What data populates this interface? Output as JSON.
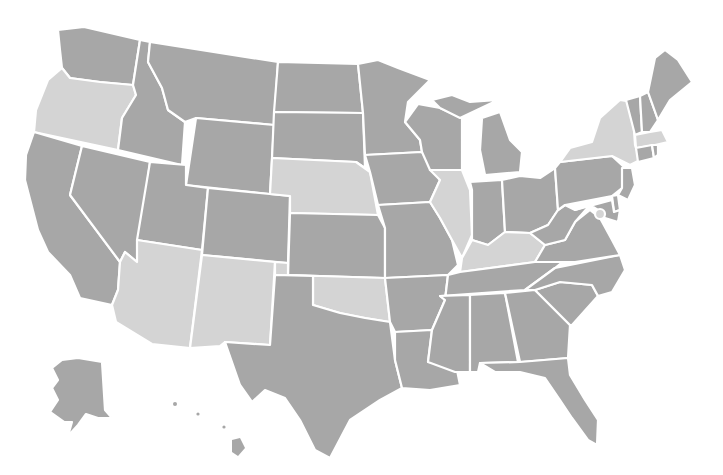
{
  "map": {
    "type": "choropleth",
    "region": "United States",
    "colors": {
      "default": "#a7a7a7",
      "highlighted": "#d4d4d4",
      "border": "#ffffff",
      "background": "#ffffff"
    },
    "highlighted_states": [
      "OR",
      "NE",
      "AZ",
      "NM",
      "OK",
      "IL",
      "KY",
      "NY",
      "MA"
    ],
    "states": [
      {
        "code": "WA",
        "fill": "dark"
      },
      {
        "code": "OR",
        "fill": "light"
      },
      {
        "code": "CA",
        "fill": "dark"
      },
      {
        "code": "ID",
        "fill": "dark"
      },
      {
        "code": "NV",
        "fill": "dark"
      },
      {
        "code": "MT",
        "fill": "dark"
      },
      {
        "code": "WY",
        "fill": "dark"
      },
      {
        "code": "UT",
        "fill": "dark"
      },
      {
        "code": "AZ",
        "fill": "light"
      },
      {
        "code": "CO",
        "fill": "dark"
      },
      {
        "code": "NM",
        "fill": "light"
      },
      {
        "code": "ND",
        "fill": "dark"
      },
      {
        "code": "SD",
        "fill": "dark"
      },
      {
        "code": "NE",
        "fill": "light"
      },
      {
        "code": "KS",
        "fill": "dark"
      },
      {
        "code": "OK",
        "fill": "light"
      },
      {
        "code": "TX",
        "fill": "dark"
      },
      {
        "code": "MN",
        "fill": "dark"
      },
      {
        "code": "IA",
        "fill": "dark"
      },
      {
        "code": "MO",
        "fill": "dark"
      },
      {
        "code": "AR",
        "fill": "dark"
      },
      {
        "code": "LA",
        "fill": "dark"
      },
      {
        "code": "WI",
        "fill": "dark"
      },
      {
        "code": "IL",
        "fill": "light"
      },
      {
        "code": "MI",
        "fill": "dark"
      },
      {
        "code": "IN",
        "fill": "dark"
      },
      {
        "code": "OH",
        "fill": "dark"
      },
      {
        "code": "KY",
        "fill": "light"
      },
      {
        "code": "TN",
        "fill": "dark"
      },
      {
        "code": "MS",
        "fill": "dark"
      },
      {
        "code": "AL",
        "fill": "dark"
      },
      {
        "code": "GA",
        "fill": "dark"
      },
      {
        "code": "FL",
        "fill": "dark"
      },
      {
        "code": "SC",
        "fill": "dark"
      },
      {
        "code": "NC",
        "fill": "dark"
      },
      {
        "code": "VA",
        "fill": "dark"
      },
      {
        "code": "WV",
        "fill": "dark"
      },
      {
        "code": "PA",
        "fill": "dark"
      },
      {
        "code": "NY",
        "fill": "light"
      },
      {
        "code": "VT",
        "fill": "dark"
      },
      {
        "code": "NH",
        "fill": "dark"
      },
      {
        "code": "ME",
        "fill": "dark"
      },
      {
        "code": "MA",
        "fill": "light"
      },
      {
        "code": "CT",
        "fill": "dark"
      },
      {
        "code": "RI",
        "fill": "dark"
      },
      {
        "code": "NJ",
        "fill": "dark"
      },
      {
        "code": "DE",
        "fill": "dark"
      },
      {
        "code": "MD",
        "fill": "dark"
      },
      {
        "code": "DC",
        "fill": "dark"
      },
      {
        "code": "AK",
        "fill": "dark"
      },
      {
        "code": "HI",
        "fill": "dark"
      }
    ]
  }
}
